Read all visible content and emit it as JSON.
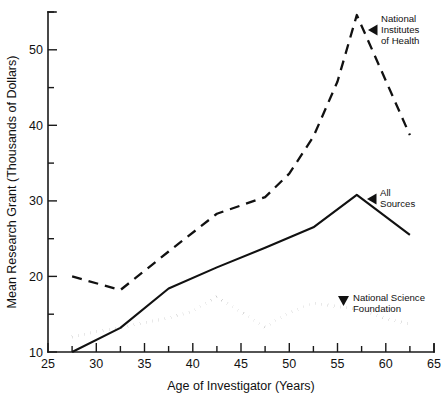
{
  "chart_data": {
    "type": "line",
    "title": "",
    "xlabel": "Age of Investigator (Years)",
    "ylabel": "Mean Research Grant (Thousands of Dollars)",
    "xlim": [
      25,
      65
    ],
    "ylim": [
      10,
      55
    ],
    "xticks": [
      25,
      30,
      35,
      40,
      45,
      50,
      55,
      60,
      65
    ],
    "xtick_labels": [
      "25",
      "30",
      "35",
      "40",
      "45",
      "50",
      "55",
      "60",
      "65"
    ],
    "xminor_ticks": [
      27.5,
      32.5,
      37.5,
      42.5,
      47.5,
      52.5,
      57.5,
      62.5
    ],
    "yticks": [
      10,
      20,
      30,
      40,
      50
    ],
    "ytick_labels": [
      "10",
      "20",
      "30",
      "40",
      "50"
    ],
    "yminor_ticks": [
      15,
      25,
      35,
      45,
      55
    ],
    "grid": false,
    "legend_position": "inline-annotations",
    "series": [
      {
        "name": "National Institutes of Health",
        "style": "dashed",
        "x": [
          27.5,
          32.5,
          37.5,
          42.5,
          47.5,
          50.0,
          52.5,
          55.0,
          57.0,
          62.5
        ],
        "values": [
          20.0,
          18.2,
          23.3,
          28.3,
          30.5,
          33.6,
          38.5,
          45.8,
          54.6,
          38.7
        ]
      },
      {
        "name": "All Sources",
        "style": "solid",
        "x": [
          27.5,
          32.5,
          37.5,
          42.5,
          47.5,
          52.5,
          57.0,
          62.5
        ],
        "values": [
          10.0,
          13.2,
          18.4,
          21.2,
          23.8,
          26.5,
          30.8,
          25.5
        ]
      },
      {
        "name": "National Science Foundation",
        "style": "dotted",
        "x": [
          27.5,
          30.0,
          32.5,
          35.0,
          37.5,
          40.0,
          42.5,
          45.0,
          47.5,
          50.0,
          52.5,
          55.0,
          57.5,
          60.0,
          62.5
        ],
        "values": [
          12.0,
          12.7,
          13.2,
          13.9,
          14.5,
          15.4,
          17.3,
          15.3,
          13.3,
          15.2,
          16.5,
          16.0,
          15.6,
          14.4,
          13.7
        ]
      }
    ],
    "annotations": [
      {
        "name": "nih-annotation",
        "lines": [
          "National",
          "Institutes",
          "of Health"
        ],
        "marker": "left-triangle"
      },
      {
        "name": "all-sources-annotation",
        "lines": [
          "All",
          "Sources"
        ],
        "marker": "left-triangle"
      },
      {
        "name": "nsf-annotation",
        "lines": [
          "National Science",
          "Foundation"
        ],
        "marker": "down-triangle"
      }
    ],
    "colors": {
      "ink": "#111111",
      "background": "#ffffff"
    }
  }
}
